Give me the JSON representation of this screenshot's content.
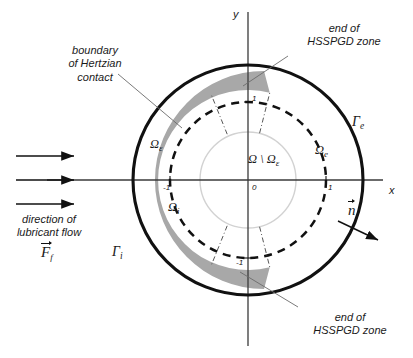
{
  "figure": {
    "axes": {
      "x_label": "x",
      "y_label": "y",
      "origin_label": "0"
    },
    "ticks": {
      "x_neg": "-1",
      "x_pos": "1",
      "y_pos": "1",
      "y_neg": "-1"
    },
    "annotations": {
      "hertzian": "boundary\nof Hertzian\ncontact",
      "hertzian_line1": "boundary",
      "hertzian_line2": "of Hertzian",
      "hertzian_line3": "contact",
      "hsspgd_top_line1": "end of",
      "hsspgd_top_line2": "HSSPGD zone",
      "hsspgd_bottom_line1": "end of",
      "hsspgd_bottom_line2": "HSSPGD zone",
      "flow_line1": "direction of",
      "flow_line2": "lubricant flow"
    },
    "symbols": {
      "gamma_e": "Γ",
      "gamma_e_sub": "e",
      "gamma_i": "Γ",
      "gamma_i_sub": "i",
      "omega_eps": "Ω",
      "omega_eps_sub": "ε",
      "omega_i": "Ω",
      "omega_i_sub": "i",
      "omega_e": "Ω",
      "omega_e_sub": "e",
      "omega_minus_main": "Ω \\ Ω",
      "omega_minus_sub": "ε",
      "normal_vector": "n",
      "force_vector": "F",
      "force_vector_sub": "f"
    },
    "colors": {
      "stroke": "#111111",
      "band_gray": "#a8a8a8",
      "inner_circle": "#d2d2d2",
      "axis": "#3a3a3a",
      "leader": "#6b6b6b",
      "background": "#ffffff"
    },
    "geometry": {
      "center_x": 248,
      "center_y": 180,
      "outer_radius": 115,
      "dashed_radius": 78,
      "inner_radius": 48,
      "band_inner_radius": 66,
      "band_outer_radius": 90,
      "band_start_angle_deg": 76,
      "band_end_angle_deg": -76
    }
  }
}
